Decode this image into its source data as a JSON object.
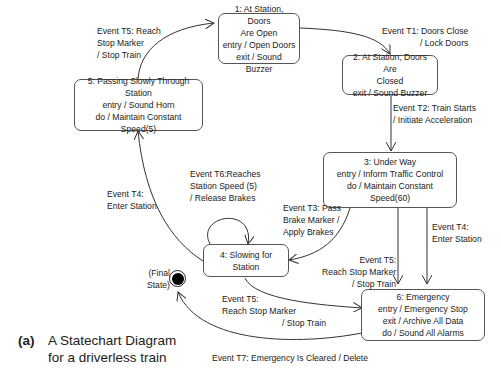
{
  "states": {
    "s1": {
      "lines": [
        "1: At Station, Doors",
        "Are Open",
        "entry / Open Doors",
        "exit / Sound Buzzer"
      ]
    },
    "s2": {
      "lines": [
        "2: At Station, Doors Are",
        "Closed",
        "exit / Sound Buzzer"
      ]
    },
    "s3": {
      "lines": [
        "3: Under Way",
        "entry / Inform Traffic Control",
        "do / Maintain Constant Speed(60)"
      ]
    },
    "s4": {
      "lines": [
        "4: Slowing for Station"
      ]
    },
    "s5": {
      "lines": [
        "5: Passing Slowly Through",
        "Station",
        "entry / Sound Horn",
        "do / Maintain Constant Speed(5)"
      ]
    },
    "s6": {
      "lines": [
        "6: Emergency",
        "entry / Emergency Stop",
        "exit / Archive All Data",
        "do / Sound  All Alarms"
      ]
    },
    "final": {
      "lines": [
        "(Final",
        "State)"
      ]
    }
  },
  "transitions": {
    "t1": {
      "lines": [
        "Event T1: Doors Close",
        "/ Lock Doors"
      ]
    },
    "t2": {
      "lines": [
        "Event T2: Train Starts",
        "/ Initiate Acceleration"
      ]
    },
    "t3": {
      "lines": [
        "Event T3: Pass",
        "Brake Marker /",
        "Apply Brakes"
      ]
    },
    "t4_3to6": {
      "lines": [
        "Event T4:",
        "Enter Station"
      ]
    },
    "t4_4to5": {
      "lines": [
        "Event T4:",
        "Enter Station"
      ]
    },
    "t5_5to1": {
      "lines": [
        "Event T5: Reach",
        "Stop Marker",
        "/ Stop Train"
      ]
    },
    "t5_3to6": {
      "lines": [
        "Event T5:",
        "Reach Stop Marker",
        "/ Stop Train"
      ]
    },
    "t5_4to6": {
      "lines": [
        "Event T5:",
        "Reach Stop Marker",
        "/ Stop Train"
      ]
    },
    "t6": {
      "lines": [
        "Event T6:Reaches",
        "Station Speed (5)",
        "/ Release Brakes"
      ]
    },
    "t7": {
      "lines": [
        "Event T7: Emergency Is Cleared / Delete"
      ]
    }
  },
  "caption": {
    "tag": "(a)",
    "lines": [
      "A Statechart Diagram",
      "for a driverless train"
    ]
  }
}
